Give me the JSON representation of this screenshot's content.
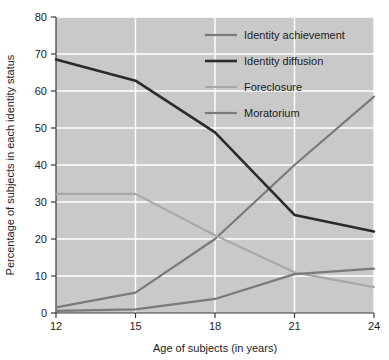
{
  "chart_data": {
    "type": "line",
    "title": "",
    "xlabel": "Age of subjects (in years)",
    "ylabel": "Percentage of subjects in each identity status",
    "x": [
      12,
      15,
      18,
      21,
      24
    ],
    "xlim": [
      12,
      24
    ],
    "ylim": [
      0,
      80
    ],
    "xticks": [
      "12",
      "15",
      "18",
      "21",
      "24"
    ],
    "yticks": [
      "0",
      "10",
      "20",
      "30",
      "40",
      "50",
      "60",
      "70",
      "80"
    ],
    "grid": true,
    "grid_color": "#ffffff",
    "plot_background": "#c9c9c9",
    "legend_position": "top-right",
    "series": [
      {
        "name": "Identity achievement",
        "color": "#7a7a7a",
        "width": 2.2,
        "values": [
          1.5,
          5.5,
          20.0,
          40.0,
          58.5
        ]
      },
      {
        "name": "Identity diffusion",
        "color": "#2b2b2b",
        "width": 2.6,
        "values": [
          68.5,
          62.8,
          48.8,
          26.5,
          22.0
        ]
      },
      {
        "name": "Foreclosure",
        "color": "#a8a8a8",
        "width": 2.2,
        "values": [
          32.2,
          32.2,
          21.0,
          11.0,
          7.0
        ]
      },
      {
        "name": "Moratorium",
        "color": "#7a7a7a",
        "width": 2.2,
        "values": [
          0.6,
          1.0,
          3.8,
          10.5,
          12.0
        ]
      }
    ]
  }
}
